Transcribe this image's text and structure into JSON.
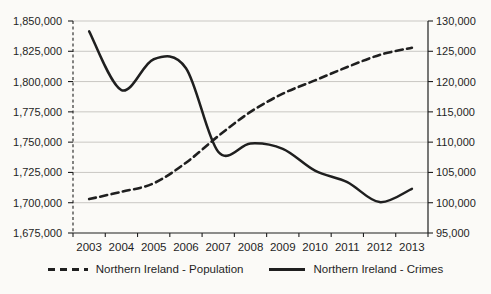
{
  "chart_data": {
    "type": "line",
    "title": "",
    "xlabel": "",
    "ylabel": "",
    "grid": true,
    "legend_position": "bottom",
    "categories": [
      "2003",
      "2004",
      "2005",
      "2006",
      "2007",
      "2008",
      "2009",
      "2010",
      "2011",
      "2012",
      "2013"
    ],
    "series": [
      {
        "name": "Northern Ireland - Population",
        "axis": "left",
        "line_style": "dashed",
        "values": [
          1703000,
          1709000,
          1716000,
          1733000,
          1755000,
          1775000,
          1790000,
          1801000,
          1812000,
          1822000,
          1828000
        ]
      },
      {
        "name": "Northern Ireland - Crimes",
        "axis": "right",
        "line_style": "solid",
        "values": [
          128300,
          118600,
          123700,
          122200,
          108400,
          109800,
          108900,
          105300,
          103400,
          100100,
          102300
        ]
      }
    ],
    "left_axis": {
      "min": 1675000,
      "max": 1850000,
      "step": 25000,
      "tick_labels": [
        "1,850,000",
        "1,825,000",
        "1,800,000",
        "1,775,000",
        "1,750,000",
        "1,725,000",
        "1,700,000",
        "1,675,000"
      ]
    },
    "right_axis": {
      "min": 95000,
      "max": 130000,
      "step": 5000,
      "tick_labels": [
        "130,000",
        "125,000",
        "120,000",
        "115,000",
        "110,000",
        "105,000",
        "100,000",
        "95,000"
      ]
    }
  },
  "colors": {
    "line": "#1f1f1f",
    "grid": "#c9c7c3",
    "background": "#fbfaf7",
    "text": "#1f1f1f"
  }
}
